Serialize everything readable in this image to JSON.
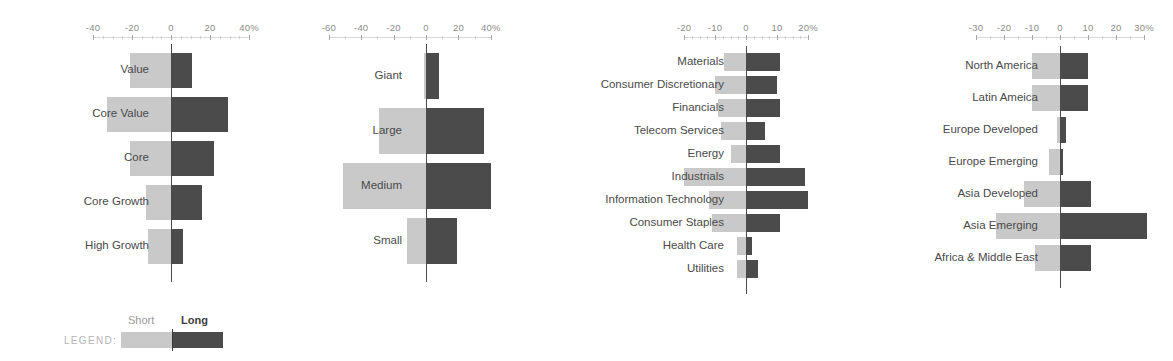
{
  "legend": {
    "title": "LEGEND:",
    "short_label": "Short",
    "long_label": "Long",
    "short_color": "#c9c9c9",
    "long_color": "#4b4b4b"
  },
  "chart_data": [
    {
      "type": "bar",
      "id": "style-box",
      "orientation": "horizontal",
      "layout": "diverging",
      "title": "",
      "xlabel": "",
      "ylabel": "",
      "xlim": [
        -40,
        40
      ],
      "ticks": [
        -40,
        -20,
        0,
        20,
        40
      ],
      "tick_labels": [
        "-40",
        "-20",
        "0",
        "20",
        "40%"
      ],
      "minor_tick_step": 5,
      "grid": false,
      "legend_position": "bottom-left",
      "categories": [
        "Value",
        "Core Value",
        "Core",
        "Core Growth",
        "High Growth"
      ],
      "series": [
        {
          "name": "Short",
          "color": "#c9c9c9",
          "values": [
            -21,
            -33,
            -21,
            -13,
            -12
          ]
        },
        {
          "name": "Long",
          "color": "#4b4b4b",
          "values": [
            11,
            29,
            22,
            16,
            6
          ]
        }
      ]
    },
    {
      "type": "bar",
      "id": "market-cap",
      "orientation": "horizontal",
      "layout": "diverging",
      "title": "",
      "xlabel": "",
      "ylabel": "",
      "xlim": [
        -60,
        40
      ],
      "ticks": [
        -60,
        -40,
        -20,
        0,
        20,
        40
      ],
      "tick_labels": [
        "-60",
        "-40",
        "-20",
        "0",
        "20",
        "40%"
      ],
      "minor_tick_step": 10,
      "grid": false,
      "categories": [
        "Giant",
        "Large",
        "Medium",
        "Small"
      ],
      "series": [
        {
          "name": "Short",
          "color": "#c9c9c9",
          "values": [
            -1,
            -29,
            -51,
            -12
          ]
        },
        {
          "name": "Long",
          "color": "#4b4b4b",
          "values": [
            8,
            36,
            40,
            19
          ]
        }
      ]
    },
    {
      "type": "bar",
      "id": "sector",
      "orientation": "horizontal",
      "layout": "diverging",
      "title": "",
      "xlabel": "",
      "ylabel": "",
      "xlim": [
        -20,
        20
      ],
      "ticks": [
        -20,
        -10,
        0,
        10,
        20
      ],
      "tick_labels": [
        "-20",
        "-10",
        "0",
        "10",
        "20%"
      ],
      "minor_tick_step": 2.5,
      "grid": false,
      "categories": [
        "Materials",
        "Consumer Discretionary",
        "Financials",
        "Telecom Services",
        "Energy",
        "Industrials",
        "Information Technology",
        "Consumer Staples",
        "Health Care",
        "Utilities"
      ],
      "series": [
        {
          "name": "Short",
          "color": "#c9c9c9",
          "values": [
            -7,
            -10,
            -9,
            -8,
            -5,
            -20,
            -12,
            -11,
            -3,
            -3
          ]
        },
        {
          "name": "Long",
          "color": "#4b4b4b",
          "values": [
            11,
            10,
            11,
            6,
            11,
            19,
            20,
            11,
            2,
            4
          ]
        }
      ]
    },
    {
      "type": "bar",
      "id": "region",
      "orientation": "horizontal",
      "layout": "diverging",
      "title": "",
      "xlabel": "",
      "ylabel": "",
      "xlim": [
        -30,
        30
      ],
      "ticks": [
        -30,
        -20,
        -10,
        0,
        10,
        20,
        30
      ],
      "tick_labels": [
        "-30",
        "-20",
        "-10",
        "0",
        "10",
        "20",
        "30%"
      ],
      "minor_tick_step": 5,
      "grid": false,
      "categories": [
        "North America",
        "Latin Ameica",
        "Europe Developed",
        "Europe Emerging",
        "Asia Developed",
        "Asia Emerging",
        "Africa & Middle East"
      ],
      "series": [
        {
          "name": "Short",
          "color": "#c9c9c9",
          "values": [
            -10,
            -10,
            -1,
            -4,
            -13,
            -23,
            -9
          ]
        },
        {
          "name": "Long",
          "color": "#4b4b4b",
          "values": [
            10,
            10,
            2,
            1,
            11,
            31,
            11
          ]
        }
      ]
    }
  ],
  "panels": [
    {
      "id": "style-box",
      "left": 0,
      "width": 290,
      "zero_x": 171,
      "px_per_unit": 1.95,
      "plot_top": 48,
      "row_height": 44,
      "bar_height": 35,
      "label_right_px": 149
    },
    {
      "id": "market-cap",
      "left": 290,
      "width": 220,
      "zero_x": 136,
      "px_per_unit": 1.62,
      "plot_top": 48,
      "row_height": 55,
      "bar_height": 46,
      "label_right_px": 112
    },
    {
      "id": "sector",
      "left": 510,
      "width": 340,
      "zero_x": 236,
      "px_per_unit": 3.1,
      "plot_top": 50,
      "row_height": 23,
      "bar_height": 18,
      "label_right_px": 214
    },
    {
      "id": "region",
      "left": 850,
      "width": 323,
      "zero_x": 210,
      "px_per_unit": 2.8,
      "plot_top": 50,
      "row_height": 32,
      "bar_height": 26,
      "label_right_px": 188
    }
  ]
}
